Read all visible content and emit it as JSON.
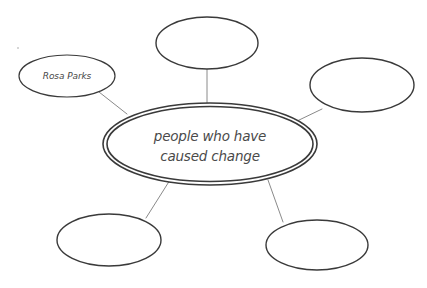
{
  "diagram": {
    "type": "concept-bubble-map",
    "background_color": "#ffffff",
    "stroke_color": "#3a3a3a",
    "connector_color": "#8a8a8a",
    "text_color": "#4a4a4a",
    "center": {
      "name": "center-bubble",
      "line1": "people who have",
      "line2": "caused change",
      "text": "people who have caused change",
      "double_outline": true,
      "cx": 210,
      "cy": 144,
      "rx": 107,
      "ry": 41
    },
    "satellites": [
      {
        "name": "bubble-top",
        "label": "",
        "cx": 207,
        "cy": 43,
        "rx": 51,
        "ry": 26
      },
      {
        "name": "bubble-rosa-parks",
        "label": "Rosa Parks",
        "cx": 67,
        "cy": 76,
        "rx": 48,
        "ry": 21
      },
      {
        "name": "bubble-right",
        "label": "",
        "cx": 362,
        "cy": 85,
        "rx": 52,
        "ry": 27
      },
      {
        "name": "bubble-bottom-left",
        "label": "",
        "cx": 109,
        "cy": 240,
        "rx": 52,
        "ry": 26
      },
      {
        "name": "bubble-bottom-right",
        "label": "",
        "cx": 317,
        "cy": 245,
        "rx": 51,
        "ry": 25
      }
    ],
    "connectors": [
      {
        "name": "connector-top",
        "x1": 207,
        "y1": 69,
        "x2": 207,
        "y2": 104
      },
      {
        "name": "connector-rosa-parks",
        "x1": 99,
        "y1": 92,
        "x2": 127,
        "y2": 114
      },
      {
        "name": "connector-right",
        "x1": 322,
        "y1": 109,
        "x2": 295,
        "y2": 122
      },
      {
        "name": "connector-bottom-left",
        "x1": 146,
        "y1": 218,
        "x2": 170,
        "y2": 180
      },
      {
        "name": "connector-bottom-right",
        "x1": 283,
        "y1": 222,
        "x2": 268,
        "y2": 180
      }
    ],
    "artifact_dot": {
      "name": "scan-artifact-dot",
      "cx": 18,
      "cy": 48,
      "r": 1
    }
  }
}
